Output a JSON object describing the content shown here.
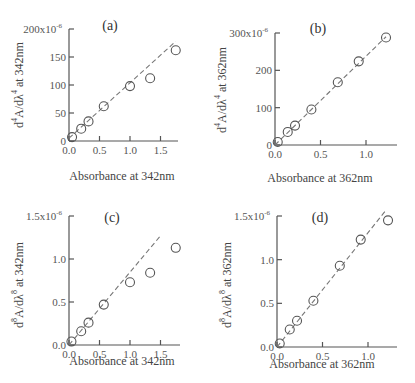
{
  "chart_data": [
    {
      "type": "scatter",
      "panel": "(a)",
      "title": "(a)",
      "xlabel": "Absorbance at 342nm",
      "ylabel": "d⁴A/dλ⁴  at 342nm",
      "ylabel_parts": {
        "main": "d",
        "sup1": "4",
        "mid": "A/dλ",
        "sup2": "4",
        "tail": " at 342nm"
      },
      "xlim": [
        0,
        1.85
      ],
      "ylim": [
        0,
        200
      ],
      "xticks": [
        0.0,
        0.5,
        1.0,
        1.5
      ],
      "xtick_labels": [
        "0.0",
        "0.5",
        "1.0",
        "1.5"
      ],
      "yticks": [
        0,
        50,
        100,
        150,
        200
      ],
      "ytick_labels": [
        "0",
        "50",
        "100",
        "150",
        "200x10⁻⁶"
      ],
      "points": [
        [
          0.05,
          7
        ],
        [
          0.2,
          22
        ],
        [
          0.32,
          35
        ],
        [
          0.57,
          62
        ],
        [
          1.0,
          98
        ],
        [
          1.33,
          112
        ],
        [
          1.75,
          162
        ]
      ],
      "fit_line": [
        [
          0.0,
          5
        ],
        [
          1.75,
          178
        ]
      ],
      "grid": false
    },
    {
      "type": "scatter",
      "panel": "(b)",
      "title": "(b)",
      "xlabel": "Absorbance at 362nm",
      "ylabel": "d⁴A/dλ⁴  at 362nm",
      "ylabel_parts": {
        "main": "d",
        "sup1": "4",
        "mid": "A/dλ",
        "sup2": "4",
        "tail": " at 362nm"
      },
      "xlim": [
        0,
        1.3
      ],
      "ylim": [
        0,
        300
      ],
      "xticks": [
        0.0,
        0.5,
        1.0
      ],
      "xtick_labels": [
        "0.0",
        "0.5",
        "1.0"
      ],
      "yticks": [
        0,
        100,
        200,
        300
      ],
      "ytick_labels": [
        "0",
        "100",
        "200",
        "300x10⁻⁶"
      ],
      "points": [
        [
          0.03,
          8
        ],
        [
          0.14,
          35
        ],
        [
          0.22,
          52
        ],
        [
          0.4,
          95
        ],
        [
          0.69,
          168
        ],
        [
          0.92,
          224
        ],
        [
          1.22,
          288
        ]
      ],
      "fit_line": [
        [
          0.0,
          0
        ],
        [
          1.22,
          290
        ]
      ],
      "grid": false
    },
    {
      "type": "scatter",
      "panel": "(c)",
      "title": "(c)",
      "xlabel": "Absorbance at 342nm",
      "ylabel": "d⁸A/dλ⁸  at 342nm",
      "ylabel_parts": {
        "main": "d",
        "sup1": "8",
        "mid": "A/dλ",
        "sup2": "8",
        "tail": " at 342nm"
      },
      "xlim": [
        0,
        1.85
      ],
      "ylim": [
        0,
        1.5
      ],
      "xticks": [
        0.0,
        0.5,
        1.0,
        1.5
      ],
      "xtick_labels": [
        "0.0",
        "0.5",
        "1.0",
        "1.5"
      ],
      "yticks": [
        0.0,
        0.5,
        1.0,
        1.5
      ],
      "ytick_labels": [
        "0.0",
        "0.5",
        "1.0",
        "1.5x10⁻⁶"
      ],
      "points": [
        [
          0.04,
          0.04
        ],
        [
          0.2,
          0.16
        ],
        [
          0.32,
          0.26
        ],
        [
          0.57,
          0.47
        ],
        [
          1.0,
          0.73
        ],
        [
          1.33,
          0.84
        ],
        [
          1.75,
          1.13
        ]
      ],
      "fit_line": [
        [
          0.0,
          0.0
        ],
        [
          1.5,
          1.27
        ]
      ],
      "grid": false
    },
    {
      "type": "scatter",
      "panel": "(d)",
      "title": "(d)",
      "xlabel": "Absorbance at 362nm",
      "ylabel": "d⁸A/dλ⁸  at 362nm",
      "ylabel_parts": {
        "main": "d",
        "sup1": "8",
        "mid": "A/dλ",
        "sup2": "8",
        "tail": " at 362nm"
      },
      "xlim": [
        0,
        1.3
      ],
      "ylim": [
        0,
        1.5
      ],
      "xticks": [
        0.0,
        0.5,
        1.0
      ],
      "xtick_labels": [
        "0.0",
        "0.5",
        "1.0"
      ],
      "yticks": [
        0.0,
        0.5,
        1.0,
        1.5
      ],
      "ytick_labels": [
        "0.0",
        "0.5",
        "1.0",
        "1.5x10⁻⁶"
      ],
      "points": [
        [
          0.03,
          0.04
        ],
        [
          0.14,
          0.2
        ],
        [
          0.22,
          0.3
        ],
        [
          0.4,
          0.53
        ],
        [
          0.69,
          0.93
        ],
        [
          0.92,
          1.23
        ],
        [
          1.22,
          1.45
        ]
      ],
      "fit_line": [
        [
          0.0,
          0.0
        ],
        [
          1.2,
          1.57
        ]
      ],
      "grid": false
    }
  ]
}
